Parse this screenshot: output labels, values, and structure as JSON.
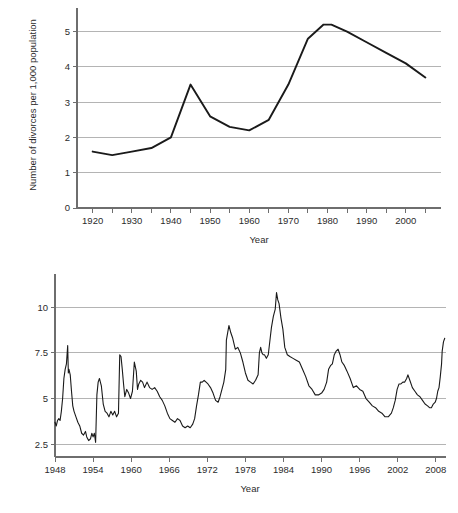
{
  "chart_data": [
    {
      "id": "divorce-rate",
      "type": "line",
      "title": "",
      "xlabel": "Year",
      "ylabel": "Number of divorces per 1,000 population",
      "xlim": [
        1916,
        2009
      ],
      "ylim": [
        0,
        5.5
      ],
      "xticks": [
        1920,
        1930,
        1940,
        1950,
        1960,
        1970,
        1980,
        1990,
        2000
      ],
      "xticklabels": [
        "1920",
        "1930",
        "1940",
        "1950",
        "1960",
        "1970",
        "1980",
        "1990",
        "2000"
      ],
      "xminorticks": [
        1925,
        1935,
        1945,
        1955,
        1965,
        1975,
        1985,
        1995,
        2005
      ],
      "yticks": [
        0,
        1,
        2,
        3,
        4,
        5
      ],
      "yticklabels": [
        "0",
        "1",
        "2",
        "3",
        "4",
        "5"
      ],
      "grid": "horizontal",
      "legend": "none",
      "x": [
        1920,
        1925,
        1930,
        1935,
        1940,
        1945,
        1950,
        1955,
        1960,
        1965,
        1970,
        1975,
        1979,
        1981,
        1985,
        1990,
        1995,
        2000,
        2005
      ],
      "values": [
        1.6,
        1.5,
        1.6,
        1.7,
        2.0,
        3.5,
        2.6,
        2.3,
        2.2,
        2.5,
        3.5,
        4.8,
        5.2,
        5.2,
        5.0,
        4.7,
        4.4,
        4.1,
        3.7
      ]
    },
    {
      "id": "unemployment-rate",
      "type": "line",
      "title": "",
      "xlabel": "Year",
      "ylabel": "Percent",
      "xlim": [
        1948,
        2009.6
      ],
      "ylim": [
        1.8,
        11.6
      ],
      "xticks": [
        1948,
        1954,
        1960,
        1966,
        1972,
        1978,
        1984,
        1990,
        1996,
        2002,
        2008
      ],
      "xticklabels": [
        "1948",
        "1954",
        "1960",
        "1966",
        "1972",
        "1978",
        "1984",
        "1990",
        "1996",
        "2002",
        "2008"
      ],
      "yticks": [
        2.5,
        5,
        7.5,
        10
      ],
      "yticklabels": [
        "2.5",
        "5",
        "7.5",
        "10"
      ],
      "grid": "horizontal",
      "legend": "none",
      "series_note": "monthly series",
      "x": [
        1948.0,
        1948.2,
        1948.4,
        1948.6,
        1948.8,
        1949.0,
        1949.2,
        1949.4,
        1949.6,
        1949.8,
        1950.0,
        1950.1,
        1950.2,
        1950.4,
        1950.6,
        1950.8,
        1951.0,
        1951.3,
        1951.6,
        1951.9,
        1952.2,
        1952.5,
        1952.8,
        1953.0,
        1953.3,
        1953.6,
        1953.8,
        1954.0,
        1954.2,
        1954.4,
        1954.6,
        1954.8,
        1955.0,
        1955.3,
        1955.6,
        1955.9,
        1956.2,
        1956.5,
        1956.8,
        1957.1,
        1957.4,
        1957.7,
        1958.0,
        1958.2,
        1958.4,
        1958.6,
        1958.8,
        1959.0,
        1959.3,
        1959.6,
        1959.9,
        1960.2,
        1960.5,
        1960.8,
        1961.0,
        1961.2,
        1961.5,
        1961.8,
        1962.1,
        1962.5,
        1962.9,
        1963.3,
        1963.7,
        1964.1,
        1964.5,
        1964.9,
        1965.3,
        1965.7,
        1966.1,
        1966.5,
        1966.9,
        1967.3,
        1967.7,
        1968.1,
        1968.5,
        1968.9,
        1969.3,
        1969.7,
        1970.0,
        1970.3,
        1970.6,
        1970.9,
        1971.2,
        1971.5,
        1971.8,
        1972.1,
        1972.5,
        1972.9,
        1973.3,
        1973.7,
        1974.0,
        1974.3,
        1974.6,
        1974.9,
        1975.0,
        1975.2,
        1975.4,
        1975.7,
        1976.0,
        1976.4,
        1976.8,
        1977.2,
        1977.6,
        1978.0,
        1978.4,
        1978.8,
        1979.2,
        1979.6,
        1980.0,
        1980.2,
        1980.4,
        1980.6,
        1980.8,
        1981.0,
        1981.3,
        1981.6,
        1981.9,
        1982.1,
        1982.4,
        1982.7,
        1982.9,
        1983.1,
        1983.3,
        1983.6,
        1983.9,
        1984.2,
        1984.6,
        1985.0,
        1985.5,
        1986.0,
        1986.5,
        1987.0,
        1987.5,
        1988.0,
        1988.5,
        1989.0,
        1989.5,
        1990.0,
        1990.4,
        1990.8,
        1991.1,
        1991.4,
        1991.7,
        1992.0,
        1992.3,
        1992.6,
        1992.9,
        1993.2,
        1993.6,
        1994.0,
        1994.5,
        1995.0,
        1995.5,
        1996.0,
        1996.5,
        1997.0,
        1997.5,
        1998.0,
        1998.5,
        1999.0,
        1999.5,
        2000.0,
        2000.5,
        2001.0,
        2001.3,
        2001.6,
        2001.9,
        2002.2,
        2002.5,
        2002.8,
        2003.1,
        2003.4,
        2003.6,
        2003.9,
        2004.3,
        2004.7,
        2005.1,
        2005.5,
        2005.9,
        2006.3,
        2006.7,
        2007.0,
        2007.3,
        2007.6,
        2007.9,
        2008.1,
        2008.3,
        2008.5,
        2008.7,
        2008.9,
        2009.0,
        2009.2,
        2009.4
      ],
      "values": [
        3.7,
        3.5,
        3.8,
        3.9,
        3.8,
        4.3,
        5.0,
        6.1,
        6.6,
        6.9,
        7.9,
        6.4,
        6.6,
        6.3,
        5.4,
        4.6,
        4.3,
        4.0,
        3.7,
        3.5,
        3.1,
        3.0,
        3.2,
        2.9,
        2.7,
        2.8,
        3.1,
        2.9,
        3.1,
        2.6,
        5.2,
        5.9,
        6.1,
        5.7,
        4.7,
        4.3,
        4.2,
        4.0,
        4.3,
        4.1,
        4.3,
        4.0,
        4.2,
        7.4,
        7.3,
        6.6,
        5.8,
        5.1,
        5.5,
        5.3,
        5.0,
        5.4,
        7.0,
        6.5,
        5.5,
        5.8,
        6.0,
        5.9,
        5.6,
        5.9,
        5.6,
        5.5,
        5.6,
        5.4,
        5.1,
        4.9,
        4.6,
        4.2,
        3.9,
        3.8,
        3.7,
        3.9,
        3.8,
        3.5,
        3.4,
        3.5,
        3.4,
        3.6,
        3.9,
        4.6,
        5.2,
        5.9,
        5.9,
        6.0,
        5.9,
        5.8,
        5.6,
        5.3,
        4.9,
        4.8,
        5.1,
        5.5,
        5.9,
        6.6,
        8.2,
        8.6,
        9.0,
        8.6,
        8.3,
        7.7,
        7.8,
        7.5,
        7.0,
        6.4,
        6.0,
        5.9,
        5.8,
        6.0,
        6.3,
        7.5,
        7.8,
        7.5,
        7.4,
        7.4,
        7.2,
        7.4,
        8.3,
        8.9,
        9.5,
        9.9,
        10.8,
        10.4,
        10.2,
        9.4,
        8.8,
        7.8,
        7.4,
        7.3,
        7.2,
        7.1,
        7.0,
        6.6,
        6.2,
        5.7,
        5.5,
        5.2,
        5.2,
        5.3,
        5.5,
        5.9,
        6.6,
        6.8,
        6.9,
        7.4,
        7.6,
        7.7,
        7.4,
        7.0,
        6.8,
        6.5,
        6.1,
        5.6,
        5.7,
        5.5,
        5.4,
        5.0,
        4.8,
        4.6,
        4.5,
        4.3,
        4.2,
        4.0,
        4.0,
        4.2,
        4.5,
        4.9,
        5.5,
        5.8,
        5.8,
        5.9,
        5.9,
        6.1,
        6.3,
        6.0,
        5.6,
        5.4,
        5.2,
        5.1,
        4.9,
        4.7,
        4.6,
        4.5,
        4.5,
        4.7,
        4.8,
        5.0,
        5.4,
        5.6,
        6.2,
        6.9,
        7.6,
        8.1,
        8.3
      ]
    }
  ]
}
